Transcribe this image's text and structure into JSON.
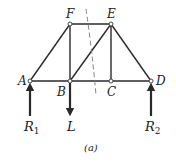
{
  "diagram": {
    "type": "truss",
    "caption": "(a)",
    "nodes": [
      {
        "id": "A",
        "label": "A",
        "x": 30,
        "y": 81
      },
      {
        "id": "B",
        "label": "B",
        "x": 70,
        "y": 81
      },
      {
        "id": "C",
        "label": "C",
        "x": 111,
        "y": 81
      },
      {
        "id": "D",
        "label": "D",
        "x": 151,
        "y": 81
      },
      {
        "id": "E",
        "label": "E",
        "x": 111,
        "y": 24
      },
      {
        "id": "F",
        "label": "F",
        "x": 70,
        "y": 24
      }
    ],
    "members": [
      [
        "A",
        "B"
      ],
      [
        "B",
        "C"
      ],
      [
        "C",
        "D"
      ],
      [
        "F",
        "E"
      ],
      [
        "A",
        "F"
      ],
      [
        "F",
        "B"
      ],
      [
        "B",
        "E"
      ],
      [
        "E",
        "C"
      ],
      [
        "E",
        "D"
      ]
    ],
    "forces": [
      {
        "id": "R1",
        "label": "R",
        "subscript": "1",
        "at": "A",
        "direction": "up"
      },
      {
        "id": "L",
        "label": "L",
        "subscript": "",
        "at": "B",
        "direction": "down"
      },
      {
        "id": "R2",
        "label": "R",
        "subscript": "2",
        "at": "D",
        "direction": "up"
      }
    ],
    "section_cut": {
      "style": "dashed",
      "passes_through": [
        "FE",
        "BE",
        "BC"
      ]
    }
  }
}
